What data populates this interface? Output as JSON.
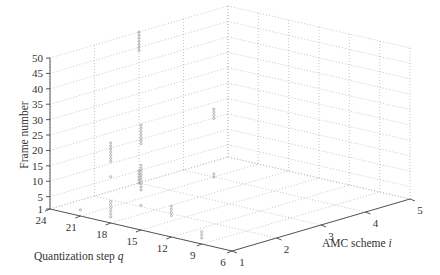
{
  "chart_data": {
    "type": "scatter",
    "projection": "3d",
    "title": "",
    "xlabel": "Quantization step q",
    "ylabel": "AMC scheme i",
    "zlabel": "Frame number",
    "x_ticks": [
      24,
      21,
      18,
      15,
      12,
      9,
      6
    ],
    "y_ticks": [
      1,
      2,
      3,
      4,
      5
    ],
    "z_ticks": [
      1,
      5,
      10,
      15,
      20,
      25,
      30,
      35,
      40,
      45,
      50
    ],
    "xlim": [
      6,
      24
    ],
    "ylim": [
      1,
      5
    ],
    "zlim": [
      1,
      50
    ],
    "grid": true,
    "marker_color": "#888888",
    "points": [
      {
        "q": 18,
        "i": 1,
        "frames": [
          3,
          4,
          5,
          6,
          7,
          8
        ]
      },
      {
        "q": 18,
        "i": 1,
        "frames": [
          16
        ]
      },
      {
        "q": 18,
        "i": 1,
        "frames": [
          21,
          22,
          23,
          24,
          25,
          26,
          27
        ]
      },
      {
        "q": 15,
        "i": 1,
        "frames": [
          14,
          15,
          16,
          17,
          18,
          19,
          20,
          21,
          22
        ]
      },
      {
        "q": 15,
        "i": 1,
        "frames": [
          29,
          30,
          31,
          32,
          33,
          34,
          35
        ]
      },
      {
        "q": 15,
        "i": 1,
        "frames": [
          9
        ]
      },
      {
        "q": 12,
        "i": 1,
        "frames": [
          8,
          9,
          10,
          11
        ]
      },
      {
        "q": 9,
        "i": 1,
        "frames": [
          3,
          4,
          5
        ]
      },
      {
        "q": 21,
        "i": 1,
        "frames": [
          3
        ]
      },
      {
        "q": 24,
        "i": 3,
        "frames": [
          1,
          2,
          3,
          4,
          5
        ]
      },
      {
        "q": 24,
        "i": 3,
        "frames": [
          44,
          45,
          46,
          47,
          48,
          49,
          50
        ]
      },
      {
        "q": 21,
        "i": 4,
        "frames": [
          1,
          2
        ]
      },
      {
        "q": 21,
        "i": 4,
        "frames": [
          20,
          21,
          22,
          23
        ]
      }
    ]
  }
}
